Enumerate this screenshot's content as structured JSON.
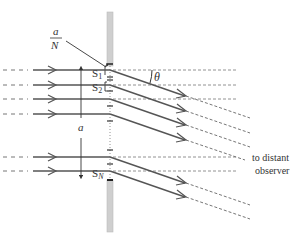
{
  "diagram": {
    "labels": {
      "slit_spacing_num": "a",
      "slit_spacing_den": "N",
      "slit1": "S",
      "slit1_sub": "1",
      "slit2": "S",
      "slit2_sub": "2",
      "slitN": "S",
      "slitN_sub": "N",
      "width": "a",
      "angle": "θ",
      "observer_line1": "to distant",
      "observer_line2": "observer"
    },
    "colors": {
      "ray": "#555555",
      "wall": "#cfcfcf",
      "dashed": "#777777",
      "text": "#333333"
    },
    "incoming_rays_y": [
      70,
      85,
      99,
      114,
      157,
      170
    ],
    "screen_x": 110,
    "angle_deg": 14
  }
}
